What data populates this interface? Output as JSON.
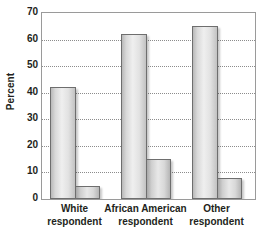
{
  "chart_data": {
    "type": "bar",
    "title": "",
    "xlabel": "",
    "ylabel": "Percent",
    "ylim": [
      0,
      70
    ],
    "yticks": [
      0,
      10,
      20,
      30,
      40,
      50,
      60,
      70
    ],
    "ytick_labels": [
      "0",
      "10",
      "20",
      "30",
      "40",
      "50",
      "60",
      "70"
    ],
    "grid": true,
    "legend": "none",
    "categories": [
      "White respondent",
      "African American respondent",
      "Other respondent"
    ],
    "category_lines": [
      [
        "White",
        "respondent"
      ],
      [
        "African American",
        "respondent"
      ],
      [
        "Other",
        "respondent"
      ]
    ],
    "series": [
      {
        "name": "series-1",
        "values": [
          42,
          62,
          65
        ]
      },
      {
        "name": "series-2",
        "values": [
          5,
          15,
          8
        ]
      }
    ],
    "bars": [
      {
        "category": "White respondent",
        "series": "series-1",
        "value": 42
      },
      {
        "category": "White respondent",
        "series": "series-2",
        "value": 5
      },
      {
        "category": "African American respondent",
        "series": "series-1",
        "value": 62
      },
      {
        "category": "African American respondent",
        "series": "series-2",
        "value": 15
      },
      {
        "category": "Other respondent",
        "series": "series-1",
        "value": 65
      },
      {
        "category": "Other respondent",
        "series": "series-2",
        "value": 8
      }
    ],
    "colors": {
      "bar_fill_light": "#efefef",
      "bar_fill_dark": "#b9b9b9",
      "bar_border": "#6e6e6e",
      "gridline": "#8c8c8c",
      "frame": "#9a9a9a",
      "text": "#231f20",
      "background": "#ffffff"
    }
  }
}
